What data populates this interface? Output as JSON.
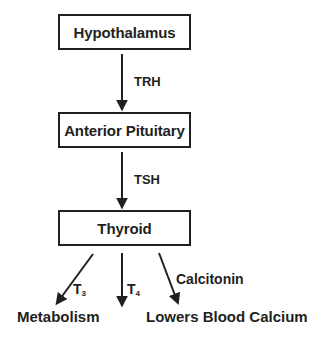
{
  "diagram": {
    "colors": {
      "stroke": "#231f20",
      "background": "#ffffff"
    },
    "nodes": [
      {
        "id": "hypothalamus",
        "label": "Hypothalamus"
      },
      {
        "id": "anterior-pituitary",
        "label": "Anterior Pituitary"
      },
      {
        "id": "thyroid",
        "label": "Thyroid"
      }
    ],
    "edge_labels": {
      "trh": "TRH",
      "tsh": "TSH",
      "calcitonin": "Calcitonin",
      "t3_symbol": "T",
      "t3_subscript": "3",
      "t4_symbol": "T",
      "t4_subscript": "4"
    },
    "outcomes": [
      {
        "id": "metabolism",
        "label": "Metabolism"
      },
      {
        "id": "lowers-blood-calcium",
        "label": "Lowers Blood Calcium"
      }
    ]
  }
}
